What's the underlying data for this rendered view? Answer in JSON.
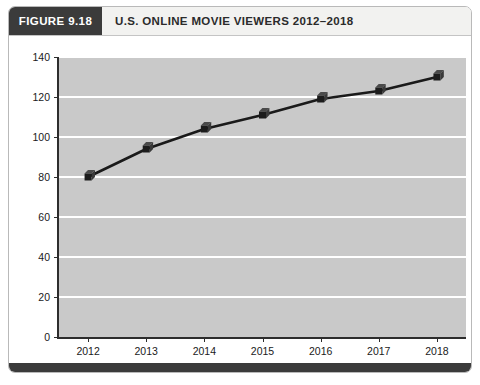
{
  "figure": {
    "label": "FIGURE 9.18",
    "title": "U.S. ONLINE MOVIE VIEWERS 2012–2018"
  },
  "colors": {
    "header_block": "#3b3b3b",
    "header_strip": "#f2f2f0",
    "plot_background": "#c9c9c9",
    "gridline": "#ffffff",
    "axis": "#2d2d2d",
    "series": "#1a1a1a",
    "footer_bar": "#3b3b3b"
  },
  "chart_data": {
    "type": "line",
    "title": "U.S. ONLINE MOVIE VIEWERS 2012–2018",
    "xlabel": "",
    "ylabel": "",
    "categories": [
      "2012",
      "2013",
      "2014",
      "2015",
      "2016",
      "2017",
      "2018"
    ],
    "values": [
      80,
      94,
      104,
      111,
      119,
      123,
      130
    ],
    "ylim": [
      0,
      140
    ],
    "yticks": [
      0,
      20,
      40,
      60,
      80,
      100,
      120,
      140
    ],
    "grid": "horizontal",
    "legend": "none",
    "marker": "cube-3d",
    "series": [
      {
        "name": "U.S. Online Movie Viewers",
        "values": [
          80,
          94,
          104,
          111,
          119,
          123,
          130
        ]
      }
    ]
  }
}
